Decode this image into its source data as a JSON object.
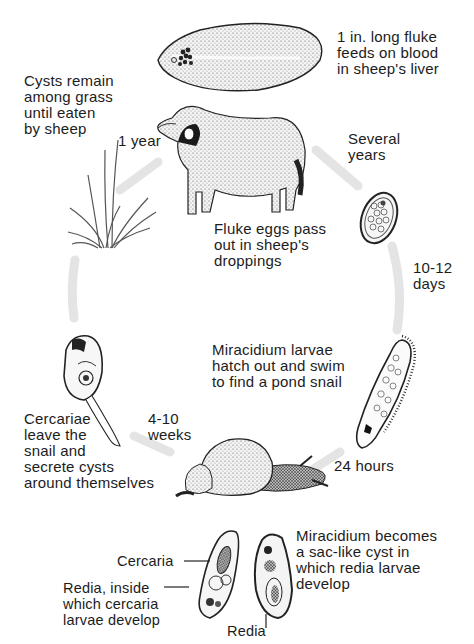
{
  "diagram": {
    "type": "life-cycle",
    "stages": [
      {
        "id": "adult-fluke",
        "label": "1 in. long fluke\nfeeds on blood\nin sheep's liver"
      },
      {
        "id": "fluke-eggs",
        "label": "Fluke eggs pass\nout in sheep's\ndroppings"
      },
      {
        "id": "miracidium",
        "label": "Miracidium larvae\nhatch out and swim\nto find a pond snail"
      },
      {
        "id": "sac-cyst",
        "label": "Miracidium becomes\na sac-like cyst in\nwhich redia larvae\ndevelop"
      },
      {
        "id": "cercariae",
        "label": "Cercariae\nleave the\nsnail and\nsecrete cysts\naround themselves"
      },
      {
        "id": "cysts-grass",
        "label": "Cysts remain\namong grass\nuntil eaten\nby sheep"
      }
    ],
    "durations": {
      "grass_to_sheep": "1 year",
      "sheep_to_eggs": "Several\nyears",
      "eggs_to_miracidium": "10-12\ndays",
      "miracidium_to_snail": "24 hours",
      "snail_to_cercariae": "4-10\nweeks"
    },
    "callouts": {
      "cercaria": "Cercaria",
      "redia_inside": "Redia, inside\nwhich cercaria\nlarvae develop",
      "redia": "Redia"
    },
    "colors": {
      "ink": "#1c1c1c",
      "arrow": "#e6e6e6",
      "background": "#ffffff"
    }
  }
}
